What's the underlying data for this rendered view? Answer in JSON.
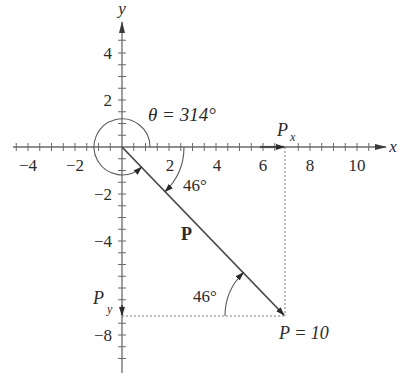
{
  "diagram": {
    "type": "vector-components",
    "axes": {
      "x_label": "x",
      "y_label": "y",
      "x_ticks": [
        "−4",
        "−2",
        "2",
        "4",
        "6",
        "8",
        "10"
      ],
      "y_ticks": [
        "4",
        "2",
        "−2",
        "−4",
        "−8"
      ]
    },
    "vector": {
      "label": "P",
      "magnitude_label": "P = 10",
      "magnitude": 10,
      "angle_deg": 314
    },
    "angle_labels": {
      "theta": "θ = 314°",
      "below_x_axis": "46°",
      "at_tip": "46°"
    },
    "components": {
      "x_label": "P",
      "x_sub": "x",
      "y_label": "P",
      "y_sub": "y"
    }
  },
  "colors": {
    "line": "#4a4a4a",
    "axis": "#6a6a6a",
    "text": "#2a2a2a",
    "background": "#ffffff"
  }
}
